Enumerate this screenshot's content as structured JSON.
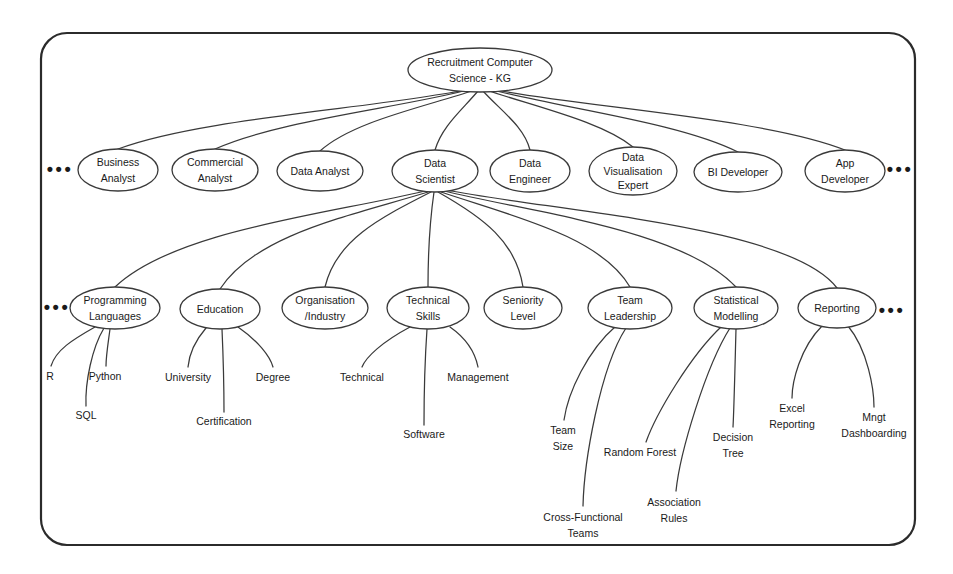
{
  "diagram": {
    "title": "Recruitment Computer Science - KG",
    "type": "knowledge-graph-tree",
    "border": {
      "color": "#2b2b2b"
    },
    "root": {
      "id": "root",
      "label_line1": "Recruitment Computer",
      "label_line2": "Science - KG",
      "cx": 480,
      "cy": 70,
      "rx": 72,
      "ry": 22
    },
    "roles": [
      {
        "id": "business-analyst",
        "label_line1": "Business",
        "label_line2": "Analyst",
        "label_line3": "",
        "cx": 118,
        "cy": 170,
        "rx": 40,
        "ry": 21
      },
      {
        "id": "commercial-analyst",
        "label_line1": "Commercial",
        "label_line2": "Analyst",
        "label_line3": "",
        "cx": 215,
        "cy": 170,
        "rx": 43,
        "ry": 21
      },
      {
        "id": "data-analyst",
        "label_line1": "Data Analyst",
        "label_line2": "",
        "label_line3": "",
        "cx": 320,
        "cy": 171,
        "rx": 43,
        "ry": 20
      },
      {
        "id": "data-scientist",
        "label_line1": "Data",
        "label_line2": "Scientist",
        "label_line3": "",
        "cx": 435,
        "cy": 171,
        "rx": 43,
        "ry": 21
      },
      {
        "id": "data-engineer",
        "label_line1": "Data",
        "label_line2": "Engineer",
        "label_line3": "",
        "cx": 530,
        "cy": 171,
        "rx": 40,
        "ry": 21
      },
      {
        "id": "data-visualisation-expert",
        "label_line1": "Data",
        "label_line2": "Visualisation",
        "label_line3": "Expert",
        "cx": 633,
        "cy": 171,
        "rx": 44,
        "ry": 24
      },
      {
        "id": "bi-developer",
        "label_line1": "BI Developer",
        "label_line2": "",
        "label_line3": "",
        "cx": 738,
        "cy": 172,
        "rx": 44,
        "ry": 20
      },
      {
        "id": "app-developer",
        "label_line1": "App",
        "label_line2": "Developer",
        "label_line3": "",
        "cx": 845,
        "cy": 171,
        "rx": 40,
        "ry": 21
      }
    ],
    "attributes": [
      {
        "id": "programming-languages",
        "label_line1": "Programming",
        "label_line2": "Languages",
        "cx": 115,
        "cy": 308,
        "rx": 45,
        "ry": 21
      },
      {
        "id": "education",
        "label_line1": "Education",
        "label_line2": "",
        "cx": 220,
        "cy": 309,
        "rx": 40,
        "ry": 20
      },
      {
        "id": "organisation-industry",
        "label_line1": "Organisation",
        "label_line2": "/Industry",
        "cx": 325,
        "cy": 308,
        "rx": 43,
        "ry": 21
      },
      {
        "id": "technical-skills",
        "label_line1": "Technical",
        "label_line2": "Skills",
        "cx": 428,
        "cy": 308,
        "rx": 41,
        "ry": 21
      },
      {
        "id": "seniority-level",
        "label_line1": "Seniority",
        "label_line2": "Level",
        "cx": 523,
        "cy": 308,
        "rx": 39,
        "ry": 21
      },
      {
        "id": "team-leadership",
        "label_line1": "Team",
        "label_line2": "Leadership",
        "cx": 630,
        "cy": 308,
        "rx": 42,
        "ry": 21
      },
      {
        "id": "statistical-modelling",
        "label_line1": "Statistical",
        "label_line2": "Modelling",
        "cx": 736,
        "cy": 308,
        "rx": 42,
        "ry": 21
      },
      {
        "id": "reporting",
        "label_line1": "Reporting",
        "label_line2": "",
        "cx": 837,
        "cy": 308,
        "rx": 39,
        "ry": 20
      }
    ],
    "leaves": [
      {
        "id": "r",
        "label_line1": "R",
        "label_line2": "",
        "x": 50,
        "y": 377,
        "parent": "programming-languages"
      },
      {
        "id": "python",
        "label_line1": "Python",
        "label_line2": "",
        "x": 105,
        "y": 377,
        "parent": "programming-languages"
      },
      {
        "id": "sql",
        "label_line1": "SQL",
        "label_line2": "",
        "x": 86,
        "y": 416,
        "parent": "programming-languages"
      },
      {
        "id": "university",
        "label_line1": "University",
        "label_line2": "",
        "x": 188,
        "y": 378,
        "parent": "education"
      },
      {
        "id": "certification",
        "label_line1": "Certification",
        "label_line2": "",
        "x": 224,
        "y": 422,
        "parent": "education"
      },
      {
        "id": "degree",
        "label_line1": "Degree",
        "label_line2": "",
        "x": 273,
        "y": 378,
        "parent": "education"
      },
      {
        "id": "technical",
        "label_line1": "Technical",
        "label_line2": "",
        "x": 362,
        "y": 378,
        "parent": "technical-skills"
      },
      {
        "id": "software",
        "label_line1": "Software",
        "label_line2": "",
        "x": 424,
        "y": 435,
        "parent": "technical-skills"
      },
      {
        "id": "management",
        "label_line1": "Management",
        "label_line2": "",
        "x": 478,
        "y": 378,
        "parent": "technical-skills"
      },
      {
        "id": "team-size",
        "label_line1": "Team",
        "label_line2": "Size",
        "x": 563,
        "y": 431,
        "parent": "team-leadership"
      },
      {
        "id": "cross-functional-teams",
        "label_line1": "Cross-Functional",
        "label_line2": "Teams",
        "x": 583,
        "y": 518,
        "parent": "team-leadership"
      },
      {
        "id": "random-forest",
        "label_line1": "Random Forest",
        "label_line2": "",
        "x": 640,
        "y": 453,
        "parent": "statistical-modelling"
      },
      {
        "id": "association-rules",
        "label_line1": "Association",
        "label_line2": "Rules",
        "x": 674,
        "y": 503,
        "parent": "statistical-modelling"
      },
      {
        "id": "decision-tree",
        "label_line1": "Decision",
        "label_line2": "Tree",
        "x": 733,
        "y": 438,
        "parent": "statistical-modelling"
      },
      {
        "id": "excel-reporting",
        "label_line1": "Excel",
        "label_line2": "Reporting",
        "x": 792,
        "y": 409,
        "parent": "reporting"
      },
      {
        "id": "mngt-dashboarding",
        "label_line1": "Mngt",
        "label_line2": "Dashboarding",
        "x": 874,
        "y": 418,
        "parent": "reporting"
      }
    ],
    "ellipses_marks": [
      {
        "id": "roles-left-ellipsis",
        "label": "•••",
        "x": 60,
        "y": 170
      },
      {
        "id": "roles-right-ellipsis",
        "label": "•••",
        "x": 900,
        "y": 170
      },
      {
        "id": "attributes-left-ellipsis",
        "label": "•••",
        "x": 57,
        "y": 308
      },
      {
        "id": "attributes-right-ellipsis",
        "label": "•••",
        "x": 892,
        "y": 311
      }
    ]
  }
}
